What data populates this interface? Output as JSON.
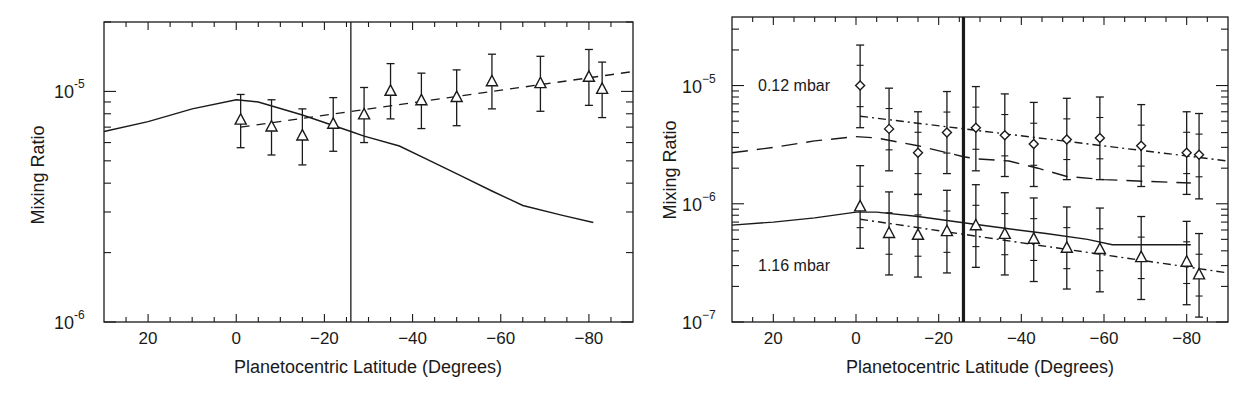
{
  "chart_data": [
    {
      "type": "line",
      "panel": "left",
      "title": "",
      "xlabel": "Planetocentric Latitude (Degrees)",
      "ylabel": "Mixing Ratio",
      "yscale": "log",
      "xlim": [
        30,
        -90
      ],
      "ylim": [
        1e-06,
        2e-05
      ],
      "xticks": [
        20,
        0,
        -20,
        -40,
        -60,
        -80
      ],
      "xtick_labels": [
        "20",
        "0",
        "−20",
        "−40",
        "−60",
        "−80"
      ],
      "yticks": [
        1e-05,
        1e-06
      ],
      "ytick_labels": [
        {
          "base": "10",
          "exp": "-5"
        },
        {
          "base": "10",
          "exp": "-6"
        }
      ],
      "vertical_line_x": -26,
      "grid": false,
      "series": [
        {
          "name": "model",
          "style": "solid",
          "x": [
            30,
            20,
            10,
            0,
            -5,
            -15,
            -26,
            -29,
            -37,
            -44,
            -51,
            -58,
            -65,
            -74,
            -81
          ],
          "y": [
            6.7e-06,
            7.4e-06,
            8.4e-06,
            9.2e-06,
            9e-06,
            7.9e-06,
            6.7e-06,
            6.4e-06,
            5.8e-06,
            5e-06,
            4.3e-06,
            3.7e-06,
            3.2e-06,
            2.9e-06,
            2.7e-06
          ]
        },
        {
          "name": "fit",
          "style": "dashed",
          "x": [
            -1,
            -90
          ],
          "y": [
            7e-06,
            1.22e-05
          ]
        },
        {
          "name": "observations",
          "style": "triangle-errorbar",
          "x": [
            -1,
            -8,
            -15,
            -22,
            -29,
            -35,
            -42,
            -50,
            -58,
            -69,
            -80,
            -83
          ],
          "y": [
            7.5e-06,
            7e-06,
            6.4e-06,
            7.2e-06,
            7.9e-06,
            1e-05,
            9.1e-06,
            9.4e-06,
            1.1e-05,
            1.08e-05,
            1.15e-05,
            1.02e-05
          ],
          "y_low": [
            5.7e-06,
            5.3e-06,
            4.8e-06,
            5.5e-06,
            6e-06,
            7.6e-06,
            6.9e-06,
            7.1e-06,
            8.4e-06,
            8.2e-06,
            8.7e-06,
            7.7e-06
          ],
          "y_high": [
            9.7e-06,
            9.2e-06,
            8.4e-06,
            9.4e-06,
            1.04e-05,
            1.32e-05,
            1.2e-05,
            1.24e-05,
            1.45e-05,
            1.42e-05,
            1.52e-05,
            1.34e-05
          ]
        }
      ]
    },
    {
      "type": "line",
      "panel": "right",
      "title": "",
      "xlabel": "Planetocentric Latitude (Degrees)",
      "ylabel": "Mixing Ratio",
      "yscale": "log",
      "xlim": [
        30,
        -90
      ],
      "ylim": [
        1e-07,
        3.8e-05
      ],
      "xticks": [
        20,
        0,
        -20,
        -40,
        -60,
        -80
      ],
      "xtick_labels": [
        "20",
        "0",
        "−20",
        "−40",
        "−60",
        "−80"
      ],
      "yticks": [
        1e-05,
        1e-06,
        1e-07
      ],
      "ytick_labels": [
        {
          "base": "10",
          "exp": "−5"
        },
        {
          "base": "10",
          "exp": "−6"
        },
        {
          "base": "10",
          "exp": "−7"
        }
      ],
      "vertical_line_x": -26,
      "grid": false,
      "annotations": [
        {
          "text": "0.12 mbar",
          "x": 18,
          "y": 1e-05
        },
        {
          "text": "1.16 mbar",
          "x": 18,
          "y": 1.6e-07
        }
      ],
      "series": [
        {
          "name": "model 0.12 mbar",
          "style": "dashed",
          "x": [
            30,
            20,
            10,
            0,
            -5,
            -15,
            -26,
            -29,
            -37,
            -44,
            -51,
            -60,
            -70,
            -81
          ],
          "y": [
            2.7e-06,
            3e-06,
            3.4e-06,
            3.7e-06,
            3.6e-06,
            3.1e-06,
            2.5e-06,
            2.4e-06,
            2.3e-06,
            2e-06,
            1.7e-06,
            1.6e-06,
            1.55e-06,
            1.5e-06
          ]
        },
        {
          "name": "fit 0.12 mbar",
          "style": "dashdot",
          "x": [
            -1,
            -90
          ],
          "y": [
            5.5e-06,
            2.3e-06
          ]
        },
        {
          "name": "observations 0.12 mbar",
          "style": "diamond-errorbar",
          "x": [
            -1,
            -8,
            -15,
            -22,
            -29,
            -36,
            -43,
            -51,
            -59,
            -69,
            -80,
            -83
          ],
          "y": [
            1e-05,
            4.3e-06,
            2.7e-06,
            4e-06,
            4.4e-06,
            3.8e-06,
            3.2e-06,
            3.5e-06,
            3.6e-06,
            3.1e-06,
            2.7e-06,
            2.6e-06
          ],
          "y_low": [
            4.4e-06,
            1.9e-06,
            1.2e-06,
            1.8e-06,
            1.9e-06,
            1.7e-06,
            1.4e-06,
            1.6e-06,
            1.6e-06,
            1.4e-06,
            1.2e-06,
            1.1e-06
          ],
          "y_high": [
            2.2e-05,
            9.5e-06,
            6e-06,
            8.9e-06,
            9.8e-06,
            8.5e-06,
            7.2e-06,
            7.8e-06,
            8e-06,
            6.9e-06,
            6e-06,
            5.8e-06
          ]
        },
        {
          "name": "model 1.16 mbar",
          "style": "solid",
          "x": [
            30,
            20,
            10,
            0,
            -5,
            -15,
            -26,
            -36,
            -46,
            -56,
            -62,
            -70,
            -81
          ],
          "y": [
            6.6e-07,
            7e-07,
            7.6e-07,
            8.5e-07,
            8.5e-07,
            7.8e-07,
            6.9e-07,
            6.2e-07,
            5.6e-07,
            5e-07,
            4.5e-07,
            4.5e-07,
            4.5e-07
          ]
        },
        {
          "name": "fit 1.16 mbar",
          "style": "dashdot",
          "x": [
            -1,
            -90
          ],
          "y": [
            7.4e-07,
            2.6e-07
          ]
        },
        {
          "name": "observations 1.16 mbar",
          "style": "triangle-errorbar",
          "x": [
            -1,
            -8,
            -15,
            -22,
            -29,
            -36,
            -43,
            -51,
            -59,
            -69,
            -80,
            -83
          ],
          "y": [
            9.4e-07,
            5.6e-07,
            5.4e-07,
            5.8e-07,
            6.5e-07,
            5.5e-07,
            5e-07,
            4.2e-07,
            4.1e-07,
            3.5e-07,
            3.2e-07,
            2.5e-07
          ],
          "y_low": [
            4.2e-07,
            2.5e-07,
            2.4e-07,
            2.6e-07,
            2.9e-07,
            2.5e-07,
            2.2e-07,
            1.9e-07,
            1.8e-07,
            1.55e-07,
            1.4e-07,
            1.1e-07
          ],
          "y_high": [
            2.1e-06,
            1.26e-06,
            1.2e-06,
            1.3e-06,
            1.45e-06,
            1.24e-06,
            1.12e-06,
            9.4e-07,
            9.2e-07,
            7.8e-07,
            7.1e-07,
            5.6e-07
          ]
        }
      ]
    }
  ],
  "panels": {
    "left": {
      "ylabel": "Mixing Ratio",
      "xlabel": "Planetocentric Latitude (Degrees)"
    },
    "right": {
      "ylabel": "Mixing Ratio",
      "xlabel": "Planetocentric Latitude (Degrees)",
      "annotation_upper": "0.12 mbar",
      "annotation_lower": "1.16 mbar"
    }
  },
  "style": {
    "ink": "#1a1a1a",
    "background": "#ffffff"
  }
}
